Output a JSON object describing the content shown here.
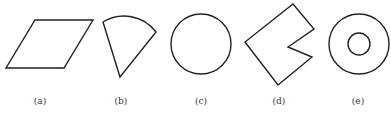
{
  "figure": {
    "shapes": [
      {
        "id": "a",
        "kind": "parallelogram",
        "label": "(a)"
      },
      {
        "id": "b",
        "kind": "circular-sector",
        "label": "(b)"
      },
      {
        "id": "c",
        "kind": "circle",
        "label": "(c)"
      },
      {
        "id": "d",
        "kind": "notched-square",
        "label": "(d)"
      },
      {
        "id": "e",
        "kind": "annulus",
        "label": "(e)"
      }
    ],
    "stroke_color": "#222222"
  }
}
